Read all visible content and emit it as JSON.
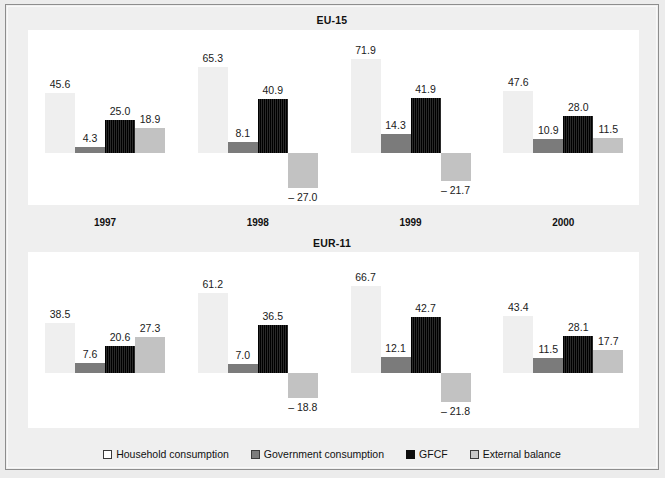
{
  "chart_data": {
    "type": "bar",
    "title": "",
    "xlabel": "",
    "ylabel": "",
    "categories": [
      "1997",
      "1998",
      "1999",
      "2000"
    ],
    "legend_position": "bottom",
    "grid": false,
    "panels": [
      {
        "title": "EU-15",
        "ylim": [
          -30,
          75
        ],
        "series": [
          {
            "name": "Household consumption",
            "values": [
              45.6,
              65.3,
              71.9,
              47.6
            ]
          },
          {
            "name": "Government consumption",
            "values": [
              4.3,
              8.1,
              14.3,
              10.9
            ]
          },
          {
            "name": "GFCF",
            "values": [
              25.0,
              40.9,
              41.9,
              28.0
            ]
          },
          {
            "name": "External balance",
            "values": [
              18.9,
              -27.0,
              -21.7,
              11.5
            ]
          }
        ],
        "labels": [
          [
            "45.6",
            "4.3",
            "25.0",
            "18.9"
          ],
          [
            "65.3",
            "8.1",
            "40.9",
            "– 27.0"
          ],
          [
            "71.9",
            "14.3",
            "41.9",
            "– 21.7"
          ],
          [
            "47.6",
            "10.9",
            "28.0",
            "11.5"
          ]
        ]
      },
      {
        "title": "EUR-11",
        "ylim": [
          -30,
          75
        ],
        "series": [
          {
            "name": "Household consumption",
            "values": [
              38.5,
              61.2,
              66.7,
              43.4
            ]
          },
          {
            "name": "Government consumption",
            "values": [
              7.6,
              7.0,
              12.1,
              11.5
            ]
          },
          {
            "name": "GFCF",
            "values": [
              20.6,
              36.5,
              42.7,
              28.1
            ]
          },
          {
            "name": "External balance",
            "values": [
              27.3,
              -18.8,
              -21.8,
              17.7
            ]
          }
        ],
        "labels": [
          [
            "38.5",
            "7.6",
            "20.6",
            "27.3"
          ],
          [
            "61.2",
            "7.0",
            "36.5",
            "– 18.8"
          ],
          [
            "66.7",
            "12.1",
            "42.7",
            "– 21.8"
          ],
          [
            "43.4",
            "11.5",
            "28.1",
            "17.7"
          ]
        ]
      }
    ],
    "legend": [
      {
        "label": "Household consumption",
        "color": "#ffffff",
        "key": "household"
      },
      {
        "label": "Government consumption",
        "color": "#7b7b7b",
        "key": "government"
      },
      {
        "label": "GFCF",
        "color": "#0d0d0d",
        "key": "gfcf"
      },
      {
        "label": "External balance",
        "color": "#c9c9c9",
        "key": "external"
      }
    ]
  },
  "panel_titles": {
    "top": "EU-15",
    "bottom": "EUR-11"
  },
  "years": [
    "1997",
    "1998",
    "1999",
    "2000"
  ],
  "colors": {
    "household": "#efefef",
    "government": "#7b7b7b",
    "gfcf": "#0d0d0d",
    "external": "#c2c2c2",
    "background": "#ececec",
    "plot": "#ffffff",
    "border": "#8d8d8d"
  }
}
